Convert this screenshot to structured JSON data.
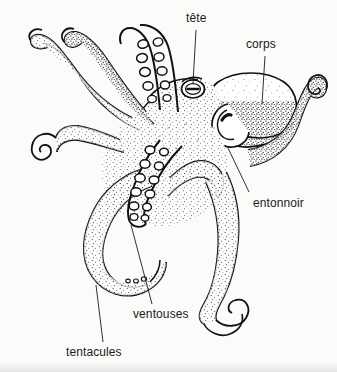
{
  "figure": {
    "kind": "anatomical-line-drawing",
    "language": "fr",
    "background_color": "#fbfbfa",
    "ink_color": "#111111",
    "labels": [
      {
        "id": "tete",
        "text": "tête",
        "meaning": "head",
        "leader_from": [
          196,
          30
        ],
        "leader_to": [
          193,
          83
        ]
      },
      {
        "id": "corps",
        "text": "corps",
        "meaning": "body / mantle",
        "leader_from": [
          265,
          56
        ],
        "leader_to": [
          262,
          104
        ]
      },
      {
        "id": "entonnoir",
        "text": "entonnoir",
        "meaning": "funnel / siphon",
        "leader_from": [
          249,
          192
        ],
        "leader_to": [
          228,
          148
        ]
      },
      {
        "id": "ventouses",
        "text": "ventouses",
        "meaning": "suckers",
        "leader_from": [
          152,
          304
        ],
        "leader_to": [
          131,
          225
        ]
      },
      {
        "id": "tentacules",
        "text": "tentacules",
        "meaning": "tentacles / arms",
        "leader_from": [
          103,
          342
        ],
        "leader_to": [
          96,
          285
        ]
      }
    ]
  }
}
